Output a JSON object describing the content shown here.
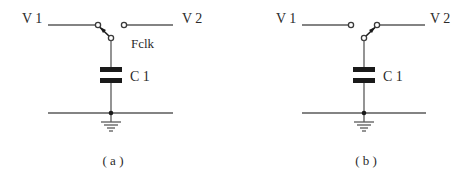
{
  "panels": [
    {
      "id": "a",
      "caption": "( a )",
      "left_label": "V 1",
      "right_label": "V 2",
      "switch_label": "Fclk",
      "capacitor_label": "C 1",
      "switch_position": "V1"
    },
    {
      "id": "b",
      "caption": "( b )",
      "left_label": "V 1",
      "right_label": "V 2",
      "switch_label": "",
      "capacitor_label": "C 1",
      "switch_position": "V2"
    }
  ],
  "colors": {
    "wire": "#5a5a5a",
    "plate": "#1a1a1a",
    "text": "#2a2a2a"
  }
}
